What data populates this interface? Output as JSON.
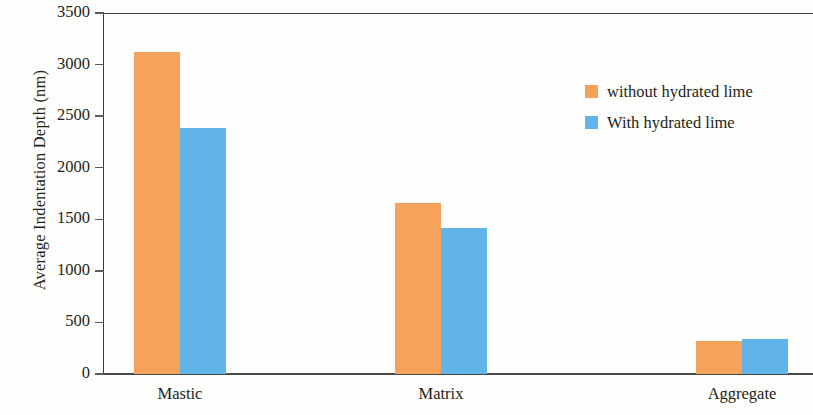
{
  "chart_data": {
    "type": "bar",
    "title": "",
    "xlabel": "",
    "ylabel": "Average Indentation Depth (nm)",
    "categories": [
      "Mastic",
      "Matrix",
      "Aggregate"
    ],
    "series": [
      {
        "name": "without hydrated lime",
        "color": "#f5a25d",
        "values": [
          3120,
          1660,
          320
        ]
      },
      {
        "name": "With hydrated lime",
        "color": "#61b4e8",
        "values": [
          2385,
          1415,
          340
        ]
      }
    ],
    "ylim": [
      0,
      3500
    ],
    "ytick_step": 500,
    "yticks": [
      0,
      500,
      1000,
      1500,
      2000,
      2500,
      3000,
      3500
    ],
    "ytick_labels": [
      "0",
      "500",
      "1000",
      "1500",
      "2000",
      "2500",
      "3000",
      "3500"
    ],
    "grid": false,
    "legend_position": "upper-right",
    "axis_color": "#3b3b3b",
    "background_color": "#fdfdfb"
  },
  "legend": {
    "entries": [
      {
        "label": "without hydrated lime",
        "color": "#f5a25d"
      },
      {
        "label": "With hydrated lime",
        "color": "#61b4e8"
      }
    ]
  }
}
